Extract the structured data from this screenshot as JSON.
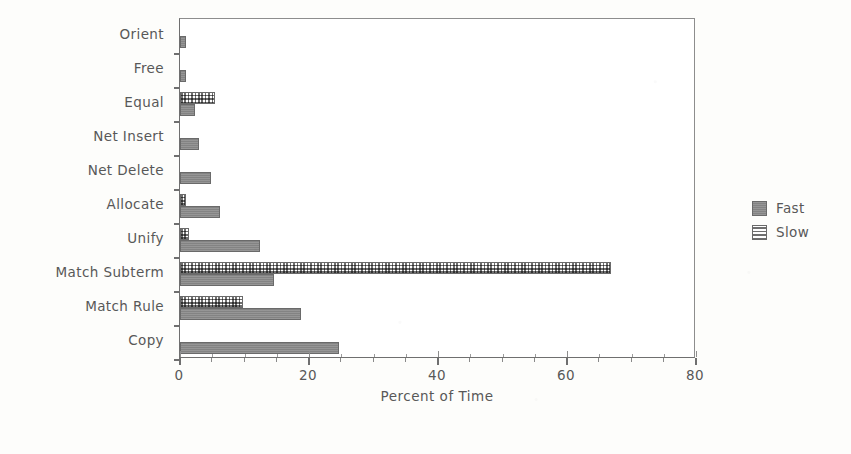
{
  "chart_data": {
    "type": "bar",
    "orientation": "horizontal",
    "title": "",
    "xlabel": "Percent of Time",
    "ylabel": "",
    "xlim": [
      0,
      80
    ],
    "xticks": [
      0,
      20,
      40,
      60,
      80
    ],
    "xtick_labels": [
      "0",
      "20",
      "40",
      "60",
      "80"
    ],
    "xminor_step": 5,
    "grid": false,
    "legend_position": "right",
    "categories": [
      "Orient",
      "Free",
      "Equal",
      "Net Insert",
      "Net Delete",
      "Allocate",
      "Unify",
      "Match Subterm",
      "Match Rule",
      "Copy"
    ],
    "series": [
      {
        "name": "Slow",
        "color": "#ffffff",
        "pattern": "crosshatch",
        "values": [
          0,
          0,
          5.4,
          0,
          0,
          1.0,
          1.4,
          66.8,
          9.7,
          0
        ]
      },
      {
        "name": "Fast",
        "color": "#8a8a8a",
        "pattern": "solid",
        "values": [
          0.9,
          0.9,
          2.3,
          2.9,
          4.8,
          6.2,
          12.4,
          14.6,
          18.8,
          24.6
        ]
      }
    ]
  },
  "legend": {
    "entries": [
      {
        "label": "Fast",
        "swatch": "solid-dark-gray"
      },
      {
        "label": "Slow",
        "swatch": "crosshatch-light"
      }
    ]
  },
  "axis": {
    "x_title": "Percent of Time"
  }
}
